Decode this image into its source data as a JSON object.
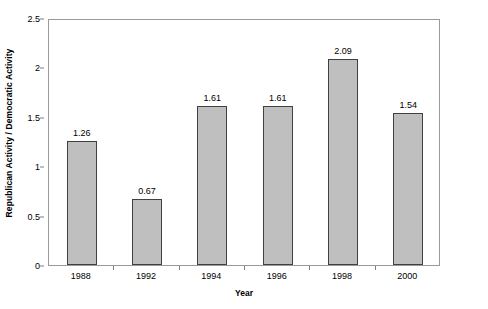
{
  "chart_data": {
    "type": "bar",
    "title": "",
    "subtitle": "",
    "xlabel": "Year",
    "ylabel": "Republican Activity / Democratic Activity",
    "categories": [
      "1988",
      "1992",
      "1994",
      "1996",
      "1998",
      "2000"
    ],
    "values": [
      1.26,
      0.67,
      1.61,
      1.61,
      2.09,
      1.54
    ],
    "data_labels": [
      "1.26",
      "0.67",
      "1.61",
      "1.61",
      "2.09",
      "1.54"
    ],
    "ylim": [
      0,
      2.5
    ],
    "ytick_values": [
      0,
      0.5,
      1,
      1.5,
      2,
      2.5
    ],
    "ytick_labels": [
      "0",
      "0.5",
      "1",
      "1.5",
      "2",
      "2.5"
    ],
    "grid": false,
    "legend": null,
    "legend_position": "none",
    "bar_fill_color": "#bfbfbf",
    "bar_border_color": "#404040",
    "plot_border_color": "#9a9a9a",
    "background_color": "#ffffff",
    "text_color": "#000000"
  }
}
